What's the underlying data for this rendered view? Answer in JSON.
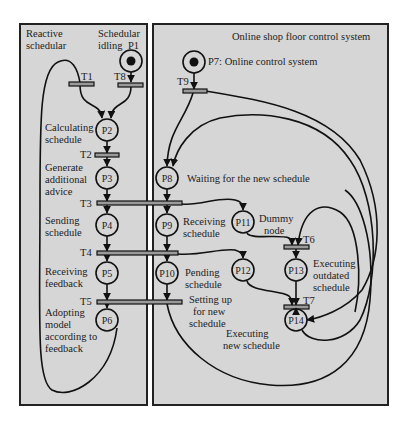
{
  "panels": {
    "left": {
      "title_lines": [
        "Reactive",
        "schedular"
      ]
    },
    "right": {
      "title": "Online shop floor control system"
    }
  },
  "places": {
    "P1": {
      "id": "P1",
      "desc_lines": [
        "Schedular",
        "idling"
      ],
      "tokens": 1
    },
    "P2": {
      "id": "P2",
      "desc_lines": [
        "Calculating",
        "schedule"
      ],
      "tokens": 0
    },
    "P3": {
      "id": "P3",
      "desc_lines": [
        "Generate",
        "additional",
        "advice"
      ],
      "tokens": 0
    },
    "P4": {
      "id": "P4",
      "desc_lines": [
        "Sending",
        "schedule"
      ],
      "tokens": 0
    },
    "P5": {
      "id": "P5",
      "desc_lines": [
        "Receiving",
        "feedback"
      ],
      "tokens": 0
    },
    "P6": {
      "id": "P6",
      "desc_lines": [
        "Adopting",
        "model",
        "according to",
        "feedback"
      ],
      "tokens": 0
    },
    "P7": {
      "id": "P7",
      "desc": "P7: Online control system",
      "tokens": 1
    },
    "P8": {
      "id": "P8",
      "desc": "Waiting for the new schedule",
      "tokens": 0
    },
    "P9": {
      "id": "P9",
      "desc_lines": [
        "Receiving",
        "schedule"
      ],
      "tokens": 0
    },
    "P10": {
      "id": "P10",
      "desc_lines": [
        "Pending",
        "schedule"
      ],
      "tokens": 0
    },
    "P11": {
      "id": "P11",
      "desc_lines": [
        "Dummy",
        "node"
      ],
      "tokens": 0
    },
    "P12": {
      "id": "P12",
      "tokens": 0
    },
    "P13": {
      "id": "P13",
      "desc_lines": [
        "Executing",
        "outdated",
        "schedule"
      ],
      "tokens": 0
    },
    "P14": {
      "id": "P14",
      "desc_lines": [
        "Executing",
        "new schedule"
      ],
      "tokens": 0
    }
  },
  "transitions": {
    "T1": "T1",
    "T2": "T2",
    "T3": "T3",
    "T4": "T4",
    "T5": "T5",
    "T6": "T6",
    "T7": "T7",
    "T8": "T8",
    "T9": "T9",
    "T5_desc_lines": [
      "Setting up",
      "for new",
      "schedule"
    ]
  }
}
